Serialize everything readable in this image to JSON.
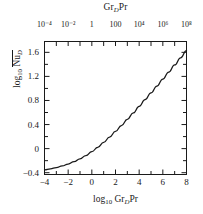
{
  "chart_data": {
    "type": "line",
    "title": "",
    "xlabel": "log 10 Gr_D Pr",
    "ylabel": "log 10 Nu_D (mean)",
    "top_axis_label": "Gr_D Pr",
    "xlim": [
      -4,
      8
    ],
    "ylim": [
      -0.43,
      1.78
    ],
    "grid": false,
    "legend": null,
    "x_ticks": [
      -4,
      -2,
      0,
      2,
      4,
      6,
      8
    ],
    "x_tick_labels": [
      "−4",
      "−2",
      "0",
      "2",
      "4",
      "6",
      "8"
    ],
    "x_minor_ticks": [
      -3,
      -1,
      1,
      3,
      5,
      7
    ],
    "y_ticks": [
      -0.4,
      0,
      0.4,
      0.8,
      1.2,
      1.6
    ],
    "y_tick_labels": [
      "−0.4",
      "0",
      "0.4",
      "0.8",
      "1.2",
      "1.6"
    ],
    "top_tick_values": [
      -4,
      -3,
      -2,
      -1,
      0,
      1,
      2,
      3,
      4,
      5,
      6,
      7,
      8
    ],
    "top_tick_labeled": [
      -4,
      -2,
      0,
      2,
      4,
      6,
      8
    ],
    "top_tick_label_text": [
      "10⁻⁴",
      "10⁻²",
      "1",
      "100",
      "10⁴",
      "10⁶",
      "10⁸"
    ],
    "series": [
      {
        "name": "Churchill-Chu horizontal cylinder correlation",
        "color": "#1a1a1a",
        "x": [
          -4.0,
          -3.5,
          -3.0,
          -2.5,
          -2.0,
          -1.5,
          -1.0,
          -0.5,
          0.0,
          0.5,
          1.0,
          1.5,
          2.0,
          2.5,
          3.0,
          3.5,
          4.0,
          4.5,
          5.0,
          5.5,
          6.0,
          6.5,
          7.0,
          7.5,
          8.0
        ],
        "y": [
          -0.352,
          -0.335,
          -0.314,
          -0.288,
          -0.256,
          -0.217,
          -0.17,
          -0.115,
          -0.051,
          0.022,
          0.103,
          0.191,
          0.285,
          0.384,
          0.487,
          0.593,
          0.702,
          0.813,
          0.926,
          1.04,
          1.156,
          1.272,
          1.39,
          1.508,
          1.627
        ]
      }
    ]
  },
  "top_axis": {
    "title_prefix": "Gr",
    "title_sub": "D",
    "title_suffix": "Pr"
  },
  "bottom_axis": {
    "title_prefix": "log",
    "title_sub_base": "10",
    "title_mid": "Gr",
    "title_sub": "D",
    "title_suffix": "Pr"
  },
  "y_axis": {
    "title_prefix": "log",
    "title_sub_base": "10",
    "title_sym": "Nu",
    "title_sub": "D"
  }
}
